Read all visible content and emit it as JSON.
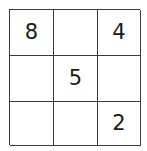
{
  "puzzle": {
    "type": "number-grid",
    "rows": 3,
    "columns": 3,
    "grid_line_color": "#3b3b3b",
    "background_color": "#ffffff",
    "digit_color": "#1a1a1a",
    "cells": [
      {
        "id": "r1c1",
        "row": 1,
        "col": 1,
        "value": "8",
        "empty": false
      },
      {
        "id": "r1c2",
        "row": 1,
        "col": 2,
        "value": "",
        "empty": true
      },
      {
        "id": "r1c3",
        "row": 1,
        "col": 3,
        "value": "4",
        "empty": false
      },
      {
        "id": "r2c1",
        "row": 2,
        "col": 1,
        "value": "",
        "empty": true
      },
      {
        "id": "r2c2",
        "row": 2,
        "col": 2,
        "value": "5",
        "empty": false
      },
      {
        "id": "r2c3",
        "row": 2,
        "col": 3,
        "value": "",
        "empty": true
      },
      {
        "id": "r3c1",
        "row": 3,
        "col": 1,
        "value": "",
        "empty": true
      },
      {
        "id": "r3c2",
        "row": 3,
        "col": 2,
        "value": "",
        "empty": true
      },
      {
        "id": "r3c3",
        "row": 3,
        "col": 3,
        "value": "2",
        "empty": false
      }
    ]
  }
}
